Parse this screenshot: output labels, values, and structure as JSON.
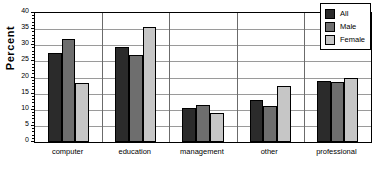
{
  "chart_data": {
    "type": "bar",
    "title": "",
    "subtitle": "",
    "xlabel": "",
    "ylabel": "Percent",
    "ylim": [
      0,
      40
    ],
    "ytick_step": 5,
    "yticks": [
      0,
      5,
      10,
      15,
      20,
      25,
      30,
      35,
      40
    ],
    "ytick_labels": [
      "0",
      "5",
      "10",
      "15",
      "20",
      "25",
      "30",
      "35",
      "40"
    ],
    "grid": true,
    "grid_axis": "y",
    "legend_position": "top-right",
    "categories": [
      "computer",
      "education",
      "management",
      "other",
      "professional"
    ],
    "series": [
      {
        "name": "All",
        "color": "#2b2b2b",
        "values": [
          27.6,
          29.5,
          10.6,
          13.0,
          18.9
        ]
      },
      {
        "name": "Male",
        "color": "#6e6e6e",
        "values": [
          32.0,
          26.9,
          11.4,
          11.1,
          18.6
        ]
      },
      {
        "name": "Female",
        "color": "#c6c6c6",
        "values": [
          18.2,
          35.6,
          9.0,
          17.5,
          20.0
        ]
      }
    ]
  },
  "legend": {
    "items": [
      {
        "label": "All",
        "color": "#2b2b2b"
      },
      {
        "label": "Male",
        "color": "#6e6e6e"
      },
      {
        "label": "Female",
        "color": "#c6c6c6"
      }
    ]
  },
  "axis": {
    "y_title": "Percent"
  }
}
